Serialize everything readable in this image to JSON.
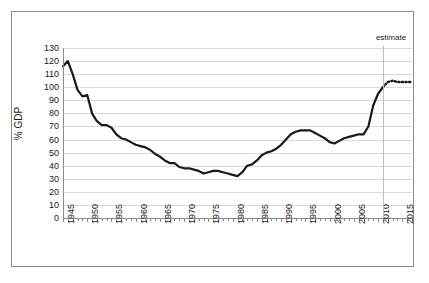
{
  "chart_data": {
    "type": "line",
    "title": "",
    "xlabel": "",
    "ylabel": "% GDP",
    "xlim": [
      1945,
      2017
    ],
    "ylim": [
      0,
      130
    ],
    "grid": true,
    "legend": false,
    "y_ticks": [
      130,
      120,
      110,
      100,
      90,
      80,
      70,
      60,
      50,
      40,
      30,
      20,
      10,
      0
    ],
    "x_tick_labels": [
      "1945",
      "1950",
      "1955",
      "1960",
      "1965",
      "1970",
      "1975",
      "1980",
      "1985",
      "1990",
      "1995",
      "2000",
      "2005",
      "2010",
      "2015"
    ],
    "x_tick_step_years": 1,
    "x_label_step_years": 5,
    "annotations": [
      {
        "name": "estimate-label",
        "text": "estimate",
        "x": 2011
      }
    ],
    "series": [
      {
        "name": "historical",
        "style": "solid",
        "color": "#1a1a1a",
        "x": [
          1945,
          1946,
          1947,
          1948,
          1949,
          1950,
          1951,
          1952,
          1953,
          1954,
          1955,
          1956,
          1957,
          1958,
          1959,
          1960,
          1961,
          1962,
          1963,
          1964,
          1965,
          1966,
          1967,
          1968,
          1969,
          1970,
          1971,
          1972,
          1973,
          1974,
          1975,
          1976,
          1977,
          1978,
          1979,
          1980,
          1981,
          1982,
          1983,
          1984,
          1985,
          1986,
          1987,
          1988,
          1989,
          1990,
          1991,
          1992,
          1993,
          1994,
          1995,
          1996,
          1997,
          1998,
          1999,
          2000,
          2001,
          2002,
          2003,
          2004,
          2005,
          2006,
          2007,
          2008,
          2009,
          2010,
          2011
        ],
        "values": [
          116,
          120,
          110,
          98,
          93,
          94,
          80,
          74,
          71,
          71,
          69,
          64,
          61,
          60,
          58,
          56,
          55,
          54,
          52,
          49,
          47,
          44,
          42,
          42,
          39,
          38,
          38,
          37,
          36,
          34,
          35,
          36,
          36,
          35,
          34,
          33,
          32,
          35,
          40,
          41,
          44,
          48,
          50,
          51,
          53,
          56,
          60,
          64,
          66,
          67,
          67,
          67,
          65,
          63,
          61,
          58,
          57,
          59,
          61,
          62,
          63,
          64,
          64,
          70,
          86,
          95,
          100
        ]
      },
      {
        "name": "estimate",
        "style": "dotted",
        "color": "#1a1a1a",
        "x": [
          2011,
          2012,
          2013,
          2014,
          2015,
          2016,
          2017
        ],
        "values": [
          100,
          104,
          105,
          104,
          104,
          104,
          104
        ]
      }
    ]
  },
  "figure": {
    "background_color": "#ffffff",
    "border_color": "#8c8c8c",
    "gridline_color": "#d9d9d9",
    "divider_color": "#bfbfbf"
  }
}
